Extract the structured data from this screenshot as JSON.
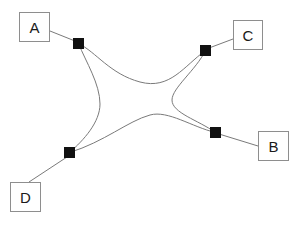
{
  "diagram": {
    "background_color": "#ffffff",
    "stroke_color": "#7a7a7a",
    "node_color": "#111111",
    "box_border_color": "#8e8e8e",
    "box_fill_color": "#ffffff",
    "text_color": "#1a1a1a",
    "labels": [
      {
        "id": "a",
        "text": "A",
        "x": 19,
        "y": 12,
        "width": 31,
        "height": 30
      },
      {
        "id": "c",
        "text": "C",
        "x": 233,
        "y": 20,
        "width": 30,
        "height": 30
      },
      {
        "id": "b",
        "text": "B",
        "x": 258,
        "y": 131,
        "width": 31,
        "height": 30
      },
      {
        "id": "d",
        "text": "D",
        "x": 10,
        "y": 182,
        "width": 31,
        "height": 30
      }
    ],
    "nodes": [
      {
        "id": "node-top-left",
        "label": "A",
        "cx": 78.5,
        "cy": 43.5,
        "size": 11
      },
      {
        "id": "node-top-right",
        "label": "C",
        "cx": 205.5,
        "cy": 50.5,
        "size": 11
      },
      {
        "id": "node-bottom-right",
        "label": "B",
        "cx": 215.5,
        "cy": 132.5,
        "size": 11
      },
      {
        "id": "node-bottom-left",
        "label": "D",
        "cx": 69.5,
        "cy": 152.5,
        "size": 11
      }
    ],
    "leader_lines": [
      {
        "id": "leader-a",
        "from": "label-box-a",
        "to": "node-top-left",
        "x1": 50,
        "y1": 31,
        "x2": 75,
        "y2": 41
      },
      {
        "id": "leader-c",
        "from": "label-box-c",
        "to": "node-top-right",
        "x1": 233,
        "y1": 39,
        "x2": 209,
        "y2": 48
      },
      {
        "id": "leader-b",
        "from": "label-box-b",
        "to": "node-bottom-right",
        "x1": 258,
        "y1": 146,
        "x2": 219,
        "y2": 134
      },
      {
        "id": "leader-d",
        "from": "label-box-d",
        "to": "node-bottom-left",
        "x1": 29,
        "y1": 182,
        "x2": 67,
        "y2": 157
      }
    ],
    "shape": {
      "id": "central-star-curve",
      "description": "Closed four-lobed concave star path joining all four nodes",
      "path": "M 78.5 43.5 C 96 52 110 74 140 82 C 170 90 184 66 205.5 50.5 C 196 70 172 88 172 100 C 172 113 198 120 215.5 132.5 C 192 127 168 110 150 115 C 128 121 104 142 69.5 152.5 C 84 140 100 122 100 104 C 100 84 86 62 78.5 43.5 Z"
    }
  }
}
